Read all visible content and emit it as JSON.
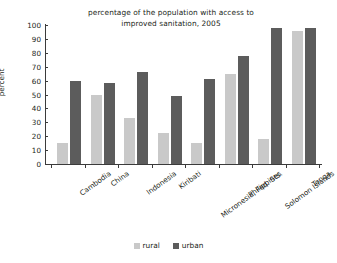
{
  "chart_data": {
    "type": "bar",
    "title": "percentage of the population with access to improved sanitation, 2005",
    "title_line1": "percentage of the population with access to",
    "title_line2": "improved sanitation, 2005",
    "xlabel": "",
    "ylabel": "percent",
    "ylim": [
      0,
      100
    ],
    "ytick_step": 10,
    "yticks": [
      100,
      90,
      80,
      70,
      60,
      50,
      40,
      30,
      20,
      10,
      0
    ],
    "grid": false,
    "legend_position": "bottom-center",
    "categories": [
      "Cambodia",
      "China",
      "Indonesia",
      "Kiribati",
      "Micronesia, Fed. Sts.",
      "Philippines",
      "Solomon Islands",
      "Tonga"
    ],
    "series": [
      {
        "name": "rural",
        "color": "#c9c9c9",
        "values": [
          15,
          50,
          33,
          22,
          15,
          65,
          18,
          96
        ]
      },
      {
        "name": "urban",
        "color": "#5c5c5c",
        "values": [
          60,
          58,
          66,
          49,
          61,
          78,
          98,
          98
        ]
      }
    ]
  },
  "colors": {
    "rural": "#c9c9c9",
    "urban": "#5c5c5c",
    "axis": "#3b3b3b",
    "text": "#231f20",
    "background": "#ffffff"
  }
}
